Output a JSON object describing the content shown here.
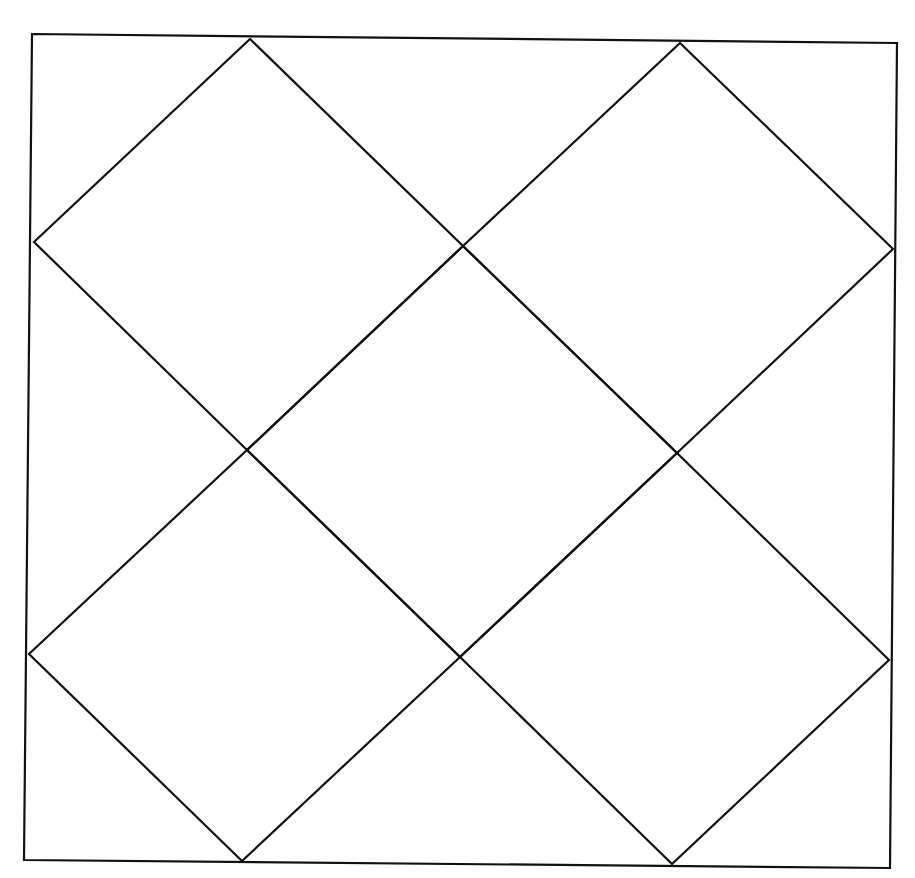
{
  "diagram": {
    "stroke_color": "#111111",
    "background_color": "#ffffff",
    "outer_frame": {
      "points": [
        [
          32,
          34
        ],
        [
          897,
          43
        ],
        [
          890,
          868
        ],
        [
          24,
          860
        ]
      ]
    },
    "diamonds": [
      {
        "name": "top-left-diamond",
        "points": [
          [
            250,
            39
          ],
          [
            463,
            246
          ],
          [
            247,
            450
          ],
          [
            34,
            242
          ]
        ]
      },
      {
        "name": "top-right-diamond",
        "points": [
          [
            680,
            43
          ],
          [
            893,
            249
          ],
          [
            677,
            453
          ],
          [
            463,
            246
          ]
        ]
      },
      {
        "name": "center-diamond",
        "points": [
          [
            463,
            246
          ],
          [
            677,
            453
          ],
          [
            460,
            657
          ],
          [
            247,
            450
          ]
        ]
      },
      {
        "name": "bottom-left-diamond",
        "points": [
          [
            247,
            450
          ],
          [
            460,
            657
          ],
          [
            242,
            861
          ],
          [
            29,
            654
          ]
        ]
      },
      {
        "name": "bottom-right-diamond",
        "points": [
          [
            677,
            453
          ],
          [
            889,
            660
          ],
          [
            672,
            864
          ],
          [
            460,
            657
          ]
        ]
      }
    ]
  }
}
